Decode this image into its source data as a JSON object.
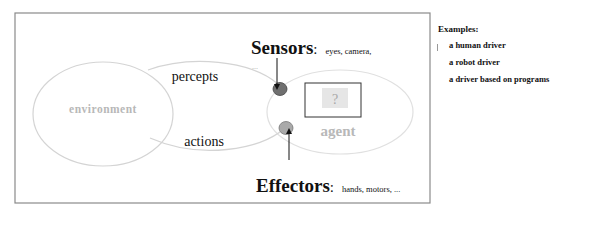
{
  "diagram": {
    "environment_label": "environment",
    "agent_label": "agent",
    "agent_box_label": "?",
    "percepts_label": "percepts",
    "actions_label": "actions",
    "sensors": {
      "title": "Sensors",
      "colon": ":",
      "examples": "eyes, camera,",
      "continuation": "..."
    },
    "effectors": {
      "title": "Effectors",
      "colon": ":",
      "examples": "hands, motors, ..."
    },
    "colors": {
      "frame": "#8a8a8a",
      "ellipse_stroke": "#d4d4d4",
      "faded_text": "#b8b8b8",
      "sensor_fill": "#6f6f6f",
      "effector_fill": "#a9a9a9",
      "text": "#111111",
      "question_bg": "#e6e6e6"
    }
  },
  "examples": {
    "title": "Examples:",
    "items": [
      "a human driver",
      "a robot driver",
      "a driver based on programs"
    ]
  }
}
